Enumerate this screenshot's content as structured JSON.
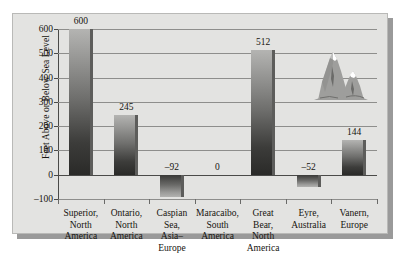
{
  "chart_data": {
    "type": "bar",
    "title": "",
    "subtitle": "",
    "xlabel": "",
    "ylabel": "Feet Above or Below Sea Level",
    "ylim": [
      -100,
      600
    ],
    "ytick_labels": [
      "600",
      "500",
      "400",
      "300",
      "200",
      "100",
      "0",
      "–100"
    ],
    "ytick_values": [
      600,
      500,
      400,
      300,
      200,
      100,
      0,
      -100
    ],
    "grid": true,
    "legend": null,
    "categories": [
      "Superior, North America",
      "Ontario, North America",
      "Caspian Sea, Asia–Europe",
      "Maracaibo, South America",
      "Great Bear, North America",
      "Eyre, Australia",
      "Vanern, Europe"
    ],
    "category_lines": [
      [
        "Superior,",
        "North",
        "America"
      ],
      [
        "Ontario,",
        "North",
        "America"
      ],
      [
        "Caspian",
        "Sea,",
        "Asia–",
        "Europe"
      ],
      [
        "Maracaibo,",
        "South",
        "America"
      ],
      [
        "Great",
        "Bear,",
        "North",
        "America"
      ],
      [
        "Eyre,",
        "Australia"
      ],
      [
        "Vanern,",
        "Europe"
      ]
    ],
    "values": [
      600,
      245,
      -92,
      0,
      512,
      -52,
      144
    ],
    "value_labels": [
      "600",
      "245",
      "–92",
      "0",
      "512",
      "–52",
      "144"
    ],
    "annotations": [
      {
        "name": "mountains-graphic",
        "description": "two snow-capped mountains"
      }
    ]
  },
  "colors": {
    "panel_background": "#e3e3e1",
    "panel_border": "#b9b9b7",
    "panel_shadow": "#9a9a9a",
    "gridline": "#8e8e8c",
    "axis": "#4a4a48",
    "text": "#16140f",
    "bar_top": "#b4b4b2",
    "bar_bottom": "#2a2a28",
    "bar_edge": "#5d5d5b",
    "mountain_body": "#9e9e9c",
    "mountain_shadow": "#6f6f6d",
    "mountain_snow": "#ffffff"
  }
}
